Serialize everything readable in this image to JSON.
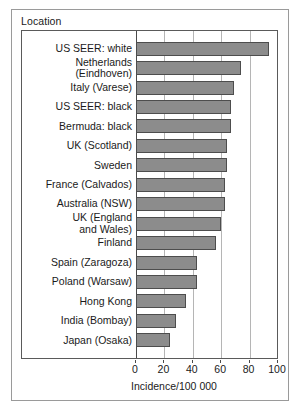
{
  "figure": {
    "legend_title": "Location"
  },
  "chart_data": {
    "type": "bar",
    "orientation": "horizontal",
    "title": "",
    "subtitle": "",
    "xlabel": "Incidence/100 000",
    "ylabel": "Location",
    "xlim": [
      0,
      100
    ],
    "xticks": [
      0,
      20,
      40,
      60,
      80,
      100
    ],
    "xticklabels": [
      "0",
      "20",
      "40",
      "60",
      "80",
      "100"
    ],
    "grid": "vertical gridlines at 20, 40, 60, 80",
    "legend": "none",
    "bar_color": "#8c8c8c",
    "bar_edge_color": "#4d4d4d",
    "categories": [
      "US SEER: white",
      "Netherlands\n(Eindhoven)",
      "Italy (Varese)",
      "US SEER: black",
      "Bermuda: black",
      "UK (Scotland)",
      "Sweden",
      "France (Calvados)",
      "Australia (NSW)",
      "UK (England\nand Wales)",
      "Finland",
      "Spain (Zaragoza)",
      "Poland (Warsaw)",
      "Hong Kong",
      "India (Bombay)",
      "Japan (Osaka)"
    ],
    "values": [
      94,
      74,
      69,
      67,
      67,
      64,
      64,
      63,
      63,
      60,
      56,
      43,
      43,
      35,
      28,
      24
    ]
  }
}
